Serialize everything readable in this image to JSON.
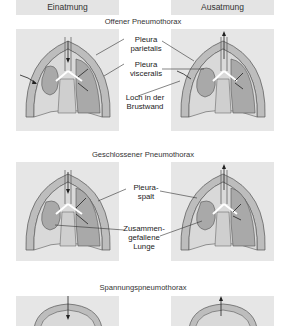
{
  "headers": {
    "left": "Einatmung",
    "right": "Ausatmung"
  },
  "sections": [
    {
      "title": "Offener Pneumothorax",
      "labels": {
        "pleura_parietalis": [
          "Pleura",
          "parietalis"
        ],
        "pleura_visceralis": [
          "Pleura",
          "visceralis"
        ],
        "loch": [
          "Loch in der",
          "Brustwand"
        ]
      }
    },
    {
      "title": "Geschlossener Pneumothorax",
      "labels": {
        "pleuraspalt": [
          "Pleura-",
          "spalt"
        ],
        "zusammengefallene_lunge": [
          "Zusammen-",
          "gefallene",
          "Lunge"
        ]
      }
    },
    {
      "title": "Spannungspneumothorax"
    }
  ],
  "colors": {
    "panel_bg": "#e6e6e6",
    "chest_wall": "#bdbdbd",
    "pleural_space": "#d9d9d9",
    "lung": "#a9a9a9",
    "mediastinum": "#cfcfcf",
    "outline": "#555555"
  }
}
